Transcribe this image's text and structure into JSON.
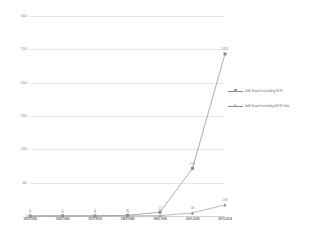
{
  "chart_data": {
    "type": "line",
    "title": "",
    "xlabel": "",
    "ylabel": "",
    "ylim": [
      0,
      3000
    ],
    "yticks": [
      0,
      500,
      1000,
      1500,
      2000,
      2500,
      3000
    ],
    "ytick_labels": [
      "0",
      "500",
      "1000",
      "1500",
      "2000",
      "2500",
      "3000"
    ],
    "grid": true,
    "legend_position": "right",
    "categories": [
      "1950-1959",
      "1960-1969",
      "1970-1979",
      "1980-1989",
      "1990-1999",
      "2000-2009",
      "2010-2014"
    ],
    "series": [
      {
        "name": "GxE Search excluding NOS",
        "marker": "square",
        "color": "#8a8a8a",
        "values": [
          1,
          2,
          3,
          11,
          57,
          714,
          2431
        ],
        "point_labels": [
          "1",
          "2",
          "3",
          "11",
          "57",
          "714",
          "2431"
        ]
      },
      {
        "name": "GxE Search including NOS Only",
        "marker": "triangle",
        "color": "#9a9a9a",
        "values": [
          0,
          0,
          0,
          1,
          6,
          46,
          168
        ],
        "point_labels": [
          "0",
          "0",
          "0",
          "1",
          "6",
          "46",
          "168"
        ]
      }
    ]
  },
  "legend": {
    "items": [
      {
        "label": "GxE Search excluding NOS"
      },
      {
        "label": "GxE Search including NOS Only"
      }
    ]
  }
}
